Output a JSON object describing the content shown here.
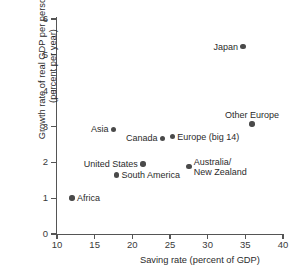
{
  "chart_data": {
    "type": "scatter",
    "title": "",
    "xlabel": "Saving rate (percent of GDP)",
    "ylabel_line1": "Growth rate of real GDP per person",
    "ylabel_line2": "(percent per year)",
    "xlim": [
      10,
      40
    ],
    "ylim": [
      0,
      6
    ],
    "xticks": [
      "10",
      "15",
      "20",
      "25",
      "30",
      "35",
      "40"
    ],
    "xtick_values": [
      10,
      15,
      20,
      25,
      30,
      35,
      40
    ],
    "yticks": [
      "0",
      "1",
      "2",
      "3",
      "4",
      "5",
      "6"
    ],
    "ytick_values": [
      0,
      1,
      2,
      3,
      4,
      5,
      6
    ],
    "grid": false,
    "legend": "none",
    "points": [
      {
        "label": "Japan",
        "x": 34.7,
        "y": 5.23,
        "label_pos": "left"
      },
      {
        "label": "Other Europe",
        "x": 35.9,
        "y": 3.07,
        "label_pos": "above"
      },
      {
        "label": "Asia",
        "x": 17.5,
        "y": 2.92,
        "label_pos": "left"
      },
      {
        "label": "Europe (big 14)",
        "x": 25.3,
        "y": 2.72,
        "label_pos": "right"
      },
      {
        "label": "Canada",
        "x": 24.0,
        "y": 2.67,
        "label_pos": "left"
      },
      {
        "label": "United States",
        "x": 21.4,
        "y": 1.95,
        "label_pos": "left"
      },
      {
        "label": "Australia/ New Zealand",
        "x": 27.5,
        "y": 1.88,
        "label_pos": "right"
      },
      {
        "label": "South America",
        "x": 17.9,
        "y": 1.65,
        "label_pos": "right"
      },
      {
        "label": "Africa",
        "x": 12.0,
        "y": 1.0,
        "label_pos": "right"
      }
    ]
  }
}
